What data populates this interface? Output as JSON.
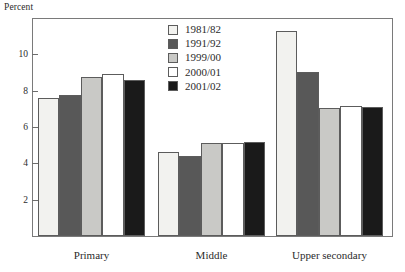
{
  "chart_data": {
    "type": "bar",
    "title": "",
    "subtitle": "",
    "xlabel": "",
    "ylabel": "Percent",
    "categories": [
      "Primary",
      "Middle",
      "Upper secondary"
    ],
    "series": [
      {
        "name": "1981/82",
        "color": "#f2f2ef",
        "values": [
          7.6,
          4.6,
          11.3
        ]
      },
      {
        "name": "1991/92",
        "color": "#585858",
        "values": [
          7.75,
          4.4,
          9.05
        ]
      },
      {
        "name": "1999/00",
        "color": "#c9c9c6",
        "values": [
          8.75,
          5.1,
          7.05
        ]
      },
      {
        "name": "2000/01",
        "color": "#ffffff",
        "values": [
          8.9,
          5.1,
          7.15
        ]
      },
      {
        "name": "2001/02",
        "color": "#1a1a1a",
        "values": [
          8.6,
          5.2,
          7.1
        ]
      }
    ],
    "ylim": [
      0,
      11.95
    ],
    "yticks": [
      2,
      4,
      6,
      8,
      10
    ],
    "ytick_labels": [
      "2",
      "4",
      "6",
      "8",
      "10"
    ],
    "grid": false,
    "legend_position": "top-center"
  },
  "legend": {
    "entries": [
      {
        "label": "1981/82"
      },
      {
        "label": "1991/92"
      },
      {
        "label": "1999/00"
      },
      {
        "label": "2000/01"
      },
      {
        "label": "2001/02"
      }
    ]
  },
  "axes": {
    "y_axis_title": "Percent"
  }
}
